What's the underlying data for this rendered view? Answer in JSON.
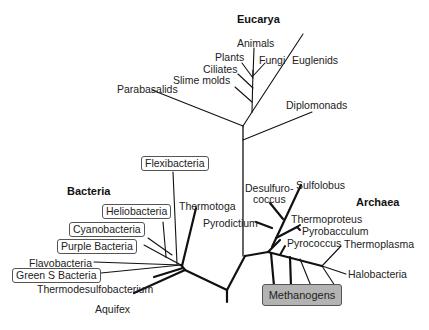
{
  "domains": {
    "eucarya": "Eucarya",
    "bacteria": "Bacteria",
    "archaea": "Archaea"
  },
  "eucarya": {
    "animals": "Animals",
    "plants": "Plants",
    "fungi": "Fungi",
    "ciliates": "Ciliates",
    "euglenids": "Euglenids",
    "slime_molds": "Slime molds",
    "parabasalids": "Parabasalids",
    "diplomonads": "Diplomonads"
  },
  "bacteria": {
    "flexibacteria": "Flexibacteria",
    "heliobacteria": "Heliobacteria",
    "cyanobacteria": "Cyanobacteria",
    "purple_bacteria": "Purple Bacteria",
    "flavobacteria": "Flavobacteria",
    "green_s_bacteria": "Green S Bacteria",
    "thermodesulfobacterium": "Thermodesulfobacterium",
    "aquifex": "Aquifex",
    "thermotoga": "Thermotoga"
  },
  "archaea": {
    "desulfurococcus_1": "Desulfuro-",
    "desulfurococcus_2": "coccus",
    "sulfolobus": "Sulfolobus",
    "pyrodictium": "Pyrodictium",
    "thermoproteus": "Thermoproteus",
    "pyrobacculum": "Pyrobacculum",
    "pyrococcus": "Pyrococcus",
    "thermoplasma": "Thermoplasma",
    "halobacteria": "Halobacteria",
    "methanogens": "Methanogens"
  },
  "colors": {
    "line": "#111111",
    "methanogens_box": "#b3b3b3",
    "box_border": "#555555"
  }
}
